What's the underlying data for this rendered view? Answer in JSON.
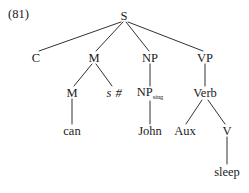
{
  "figure": {
    "example_number": "(81)",
    "type": "syntax-tree",
    "ink_color": "#1a1a1a",
    "background_color": "#ffffff"
  },
  "nodes": [
    {
      "id": "S",
      "label": "S",
      "x": 124,
      "y": 16,
      "style": "plain"
    },
    {
      "id": "C",
      "label": "C",
      "x": 36,
      "y": 58,
      "style": "plain"
    },
    {
      "id": "M1",
      "label": "M",
      "x": 94,
      "y": 58,
      "style": "plain"
    },
    {
      "id": "NP",
      "label": "NP",
      "x": 150,
      "y": 58,
      "style": "plain"
    },
    {
      "id": "VP",
      "label": "VP",
      "x": 205,
      "y": 58,
      "style": "plain"
    },
    {
      "id": "M2",
      "label": "M",
      "x": 72,
      "y": 93,
      "style": "plain"
    },
    {
      "id": "SHASH",
      "label": "s #",
      "x": 114,
      "y": 93,
      "style": "italic"
    },
    {
      "id": "NPsing",
      "label": "NP",
      "sub": "sing",
      "x": 150,
      "y": 93,
      "style": "sub"
    },
    {
      "id": "Verb",
      "label": "Verb",
      "x": 205,
      "y": 93,
      "style": "plain"
    },
    {
      "id": "can",
      "label": "can",
      "x": 72,
      "y": 131,
      "style": "plain"
    },
    {
      "id": "John",
      "label": "John",
      "x": 150,
      "y": 131,
      "style": "plain"
    },
    {
      "id": "Aux",
      "label": "Aux",
      "x": 185,
      "y": 131,
      "style": "plain"
    },
    {
      "id": "V",
      "label": "V",
      "x": 227,
      "y": 131,
      "style": "plain"
    },
    {
      "id": "sleep",
      "label": "sleep",
      "x": 227,
      "y": 172,
      "style": "plain"
    }
  ],
  "edges": [
    {
      "from": "S",
      "to": "C",
      "x1": 121,
      "y1": 22,
      "x2": 39,
      "y2": 51
    },
    {
      "from": "S",
      "to": "M1",
      "x1": 123,
      "y1": 22,
      "x2": 96,
      "y2": 51
    },
    {
      "from": "S",
      "to": "NP",
      "x1": 126,
      "y1": 22,
      "x2": 149,
      "y2": 51
    },
    {
      "from": "S",
      "to": "VP",
      "x1": 128,
      "y1": 22,
      "x2": 203,
      "y2": 51
    },
    {
      "from": "M1",
      "to": "M2",
      "x1": 92,
      "y1": 64,
      "x2": 74,
      "y2": 86
    },
    {
      "from": "M1",
      "to": "SHASH",
      "x1": 96,
      "y1": 64,
      "x2": 112,
      "y2": 86
    },
    {
      "from": "NP",
      "to": "NPsing",
      "x1": 150,
      "y1": 64,
      "x2": 150,
      "y2": 86
    },
    {
      "from": "VP",
      "to": "Verb",
      "x1": 205,
      "y1": 64,
      "x2": 205,
      "y2": 86
    },
    {
      "from": "M2",
      "to": "can",
      "x1": 72,
      "y1": 99,
      "x2": 72,
      "y2": 124
    },
    {
      "from": "NPsing",
      "to": "John",
      "x1": 150,
      "y1": 101,
      "x2": 150,
      "y2": 124
    },
    {
      "from": "Verb",
      "to": "Aux",
      "x1": 202,
      "y1": 100,
      "x2": 186,
      "y2": 124
    },
    {
      "from": "Verb",
      "to": "V",
      "x1": 208,
      "y1": 100,
      "x2": 225,
      "y2": 124
    },
    {
      "from": "V",
      "to": "sleep",
      "x1": 227,
      "y1": 137,
      "x2": 227,
      "y2": 164
    }
  ]
}
